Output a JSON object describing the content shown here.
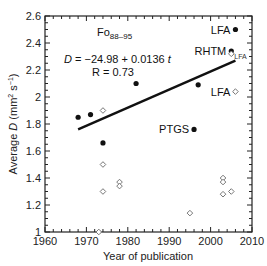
{
  "chart_data": {
    "type": "scatter",
    "title": "",
    "xlabel": "Year of publication",
    "ylabel": "Average D (mm² s⁻¹)",
    "xlim": [
      1960,
      2010
    ],
    "ylim": [
      1.0,
      2.6
    ],
    "x_ticks": [
      "1960",
      "1970",
      "1980",
      "1990",
      "2000",
      "2010"
    ],
    "y_ticks": [
      "1",
      "1.2",
      "1.4",
      "1.6",
      "1.8",
      "2",
      "2.2",
      "2.4",
      "2.6"
    ],
    "grid": false,
    "series": [
      {
        "name": "filled",
        "marker": "filled-circle",
        "points": [
          {
            "x": 1968,
            "y": 1.85,
            "label": ""
          },
          {
            "x": 1971,
            "y": 1.87,
            "label": ""
          },
          {
            "x": 1974,
            "y": 1.66,
            "label": ""
          },
          {
            "x": 1982,
            "y": 2.1,
            "label": ""
          },
          {
            "x": 1996,
            "y": 1.76,
            "label": "PTGS"
          },
          {
            "x": 1997,
            "y": 2.09,
            "label": ""
          },
          {
            "x": 2005,
            "y": 2.34,
            "label": "RHTM"
          },
          {
            "x": 2006,
            "y": 2.5,
            "label": "LFA"
          }
        ]
      },
      {
        "name": "open",
        "marker": "open-diamond",
        "points": [
          {
            "x": 1973,
            "y": 1.0,
            "label": ""
          },
          {
            "x": 1974,
            "y": 1.9,
            "label": ""
          },
          {
            "x": 1974,
            "y": 1.5,
            "label": ""
          },
          {
            "x": 1974,
            "y": 1.3,
            "label": ""
          },
          {
            "x": 1978,
            "y": 1.37,
            "label": ""
          },
          {
            "x": 1978,
            "y": 1.34,
            "label": ""
          },
          {
            "x": 1995,
            "y": 1.14,
            "label": ""
          },
          {
            "x": 2003,
            "y": 1.4,
            "label": ""
          },
          {
            "x": 2003,
            "y": 1.37,
            "label": ""
          },
          {
            "x": 2003,
            "y": 1.28,
            "label": ""
          },
          {
            "x": 2005,
            "y": 1.3,
            "label": ""
          },
          {
            "x": 2006,
            "y": 2.04,
            "label": "LFA"
          },
          {
            "x": 2005,
            "y": 2.32,
            "label": "LFA"
          }
        ]
      }
    ],
    "fit_line": {
      "x0": 1968,
      "y0": 1.76,
      "x1": 2006,
      "y1": 2.27
    },
    "annotations": {
      "composition_main": "Fo",
      "composition_sub": "88–95",
      "equation_lhs": "D",
      "equation_rhs": " = −24.98 + 0.0136 ",
      "equation_var": "t",
      "r_value": "R = 0.73"
    }
  }
}
